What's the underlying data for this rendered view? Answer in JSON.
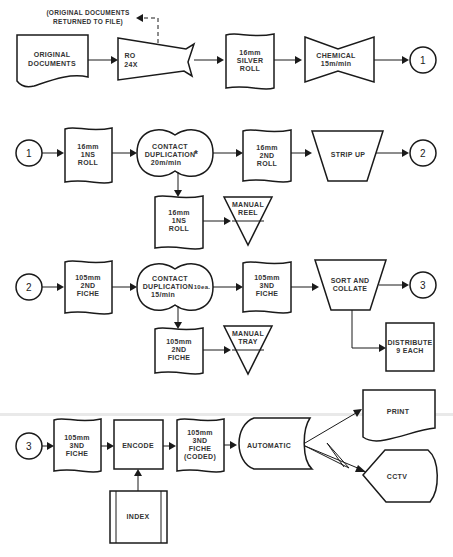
{
  "diagram": {
    "type": "process-flowchart",
    "connectors": {
      "c1": "1",
      "c2": "2",
      "c3": "3"
    },
    "rows": [
      {
        "nodes": {
          "original_documents": [
            "ORIGINAL",
            "DOCUMENTS"
          ],
          "ro": [
            "RO",
            "24X"
          ],
          "silver_roll": [
            "16mm",
            "SILVER",
            "ROLL"
          ],
          "chemical": [
            "CHEMICAL",
            "15m/min"
          ]
        },
        "note": [
          "(ORIGINAL DOCUMENTS",
          "RETURNED TO FILE)"
        ]
      },
      {
        "nodes": {
          "ins_roll": [
            "16mm",
            "1NS",
            "ROLL"
          ],
          "contact_dup": [
            "CONTACT",
            "DUPLICATION",
            "20m/min"
          ],
          "contact_dup_mark": "*",
          "second_roll": [
            "16mm",
            "2ND",
            "ROLL"
          ],
          "strip_up": "STRIP UP",
          "ins_roll_copy": [
            "16mm",
            "1NS",
            "ROLL"
          ],
          "manual_reel": [
            "MANUAL",
            "REEL"
          ]
        }
      },
      {
        "nodes": {
          "second_fiche": [
            "105mm",
            "2ND",
            "FICHE"
          ],
          "contact_dup": [
            "CONTACT",
            "DUPLICATION",
            "15/min"
          ],
          "contact_dup_qty": "10ea.",
          "third_fiche": [
            "105mm",
            "3ND",
            "FICHE"
          ],
          "sort_collate": [
            "SORT AND",
            "COLLATE"
          ],
          "second_fiche_copy": [
            "105mm",
            "2ND",
            "FICHE"
          ],
          "manual_tray": [
            "MANUAL",
            "TRAY"
          ],
          "distribute": [
            "DISTRIBUTE",
            "9 EACH"
          ]
        }
      },
      {
        "nodes": {
          "third_fiche": [
            "105mm",
            "3ND",
            "FICHE"
          ],
          "encode": "ENCODE",
          "third_fiche_coded": [
            "105mm",
            "3ND",
            "FICHE",
            "(CODED)"
          ],
          "automatic": "AUTOMATIC",
          "print": "PRINT",
          "cctv": "CCTV",
          "index": "INDEX"
        }
      }
    ]
  }
}
